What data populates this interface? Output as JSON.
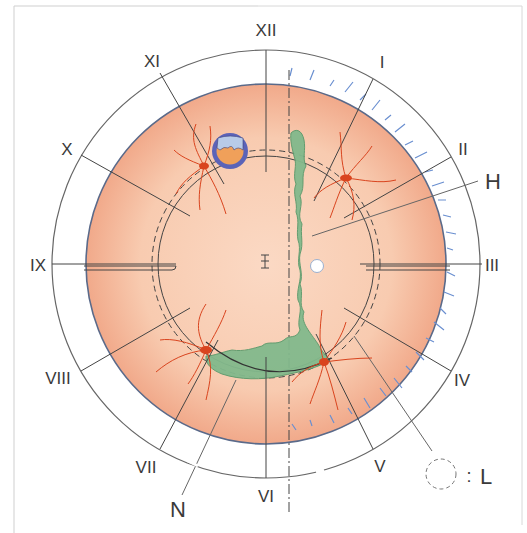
{
  "diagram": {
    "type": "fundus-clock-chart",
    "center": [
      266,
      264
    ],
    "radii": {
      "outer_ring": 214,
      "fundus": 180,
      "dashed_circle": 114,
      "solid_circle": 108
    },
    "clock_hours": [
      {
        "label": "XII",
        "angle": 0
      },
      {
        "label": "I",
        "angle": 30
      },
      {
        "label": "II",
        "angle": 60
      },
      {
        "label": "III",
        "angle": 90
      },
      {
        "label": "IV",
        "angle": 120
      },
      {
        "label": "V",
        "angle": 150
      },
      {
        "label": "VI",
        "angle": 180
      },
      {
        "label": "VII",
        "angle": 210
      },
      {
        "label": "VIII",
        "angle": 240
      },
      {
        "label": "IX",
        "angle": 270
      },
      {
        "label": "X",
        "angle": 300
      },
      {
        "label": "XI",
        "angle": 330
      }
    ],
    "callouts": {
      "H": "H",
      "N": "N",
      "L": "L",
      "legend_sep": ":"
    },
    "center_mark": "I",
    "colors": {
      "fundus": "#f7c9ae",
      "fundus_edge": "#eea588",
      "rim": "#5a6a8a",
      "ring_line": "#555555",
      "lesion_green": "#7fb58a",
      "lesion_green_edge": "#5c9a6c",
      "vessel_red": "#d9441e",
      "retinal_tear_blue": "#5b63b8",
      "retinal_tear_light": "#b8cbe8",
      "retinal_tear_orange": "#f0a05a",
      "detachment_blue": "#6a8fd0"
    }
  }
}
